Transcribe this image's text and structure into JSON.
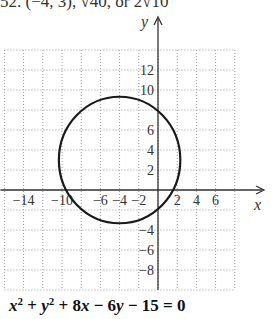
{
  "header": {
    "partial_text": "52. (−4, 3), √40, or 2√10"
  },
  "chart_data": {
    "type": "line",
    "title": "",
    "xlabel": "x",
    "ylabel": "y",
    "xlim": [
      -16,
      8
    ],
    "ylim": [
      -10,
      14
    ],
    "grid": true,
    "grid_style": "dotted",
    "x_tick_labels": [
      "-14",
      "-10",
      "-6",
      "-4",
      "-2",
      "2",
      "4",
      "6"
    ],
    "x_tick_values": [
      -14,
      -10,
      -6,
      -4,
      -2,
      2,
      4,
      6
    ],
    "y_tick_labels": [
      "12",
      "10",
      "6",
      "4",
      "2",
      "-4",
      "-6",
      "-8"
    ],
    "y_tick_values": [
      12,
      10,
      6,
      4,
      2,
      -4,
      -6,
      -8
    ],
    "series": [
      {
        "name": "circle",
        "shape": "circle",
        "center": [
          -4,
          3
        ],
        "radius": 6.3246,
        "equation": "x^2 + y^2 + 8x - 6y - 15 = 0"
      }
    ]
  },
  "equation": {
    "x": "x",
    "y": "y",
    "exp": "2",
    "plus1": " + ",
    "plus2": " + 8",
    "rest": " − 6",
    "tail": " − 15 = 0"
  }
}
